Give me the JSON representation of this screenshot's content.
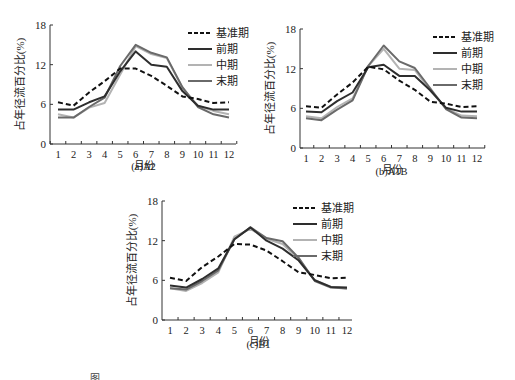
{
  "figure": {
    "caption_partial": "图"
  },
  "legend": {
    "baseline": "基准期",
    "early": "前期",
    "mid": "中期",
    "late": "末期"
  },
  "colors": {
    "baseline": "#111111",
    "early": "#2e2e2e",
    "mid": "#b3b3b3",
    "late": "#6a6a6a"
  },
  "chart_data": [
    {
      "type": "line",
      "title": "(a)A2",
      "xlabel": "月份",
      "ylabel": "占年径流百分比(%)",
      "ylim": [
        0,
        18
      ],
      "yticks": [
        0,
        6,
        12,
        18
      ],
      "grid": false,
      "legend_position": "upper right",
      "x": [
        1,
        2,
        3,
        4,
        5,
        6,
        7,
        8,
        9,
        10,
        11,
        12
      ],
      "series": [
        {
          "name": "基准期",
          "style": "dashed",
          "values": [
            6.3,
            5.8,
            7.8,
            9.5,
            11.4,
            11.4,
            10.3,
            8.8,
            7.2,
            6.8,
            6.2,
            6.3
          ]
        },
        {
          "name": "前期",
          "style": "solid",
          "values": [
            5.2,
            5.2,
            6.3,
            7.2,
            11.0,
            14.0,
            12.0,
            11.7,
            8.0,
            5.8,
            5.2,
            5.2
          ]
        },
        {
          "name": "中期",
          "style": "solid",
          "values": [
            4.5,
            4.0,
            5.5,
            6.2,
            10.5,
            14.8,
            13.6,
            13.0,
            8.5,
            5.8,
            5.0,
            4.5
          ]
        },
        {
          "name": "末期",
          "style": "solid",
          "values": [
            4.0,
            4.0,
            5.6,
            7.0,
            11.8,
            15.0,
            13.8,
            13.1,
            8.6,
            5.6,
            4.5,
            4.0
          ]
        }
      ]
    },
    {
      "type": "line",
      "title": "(b)A1B",
      "xlabel": "月份",
      "ylabel": "占年径流百分比(%)",
      "ylim": [
        0,
        18
      ],
      "yticks": [
        0,
        6,
        12,
        18
      ],
      "grid": false,
      "legend_position": "upper right",
      "x": [
        1,
        2,
        3,
        4,
        5,
        6,
        7,
        8,
        9,
        10,
        11,
        12
      ],
      "series": [
        {
          "name": "基准期",
          "style": "dashed",
          "values": [
            6.3,
            6.1,
            8.1,
            9.9,
            12.3,
            11.9,
            10.2,
            8.8,
            7.0,
            6.7,
            6.2,
            6.3
          ]
        },
        {
          "name": "前期",
          "style": "solid",
          "values": [
            5.5,
            5.4,
            7.1,
            8.4,
            12.2,
            12.6,
            10.9,
            10.9,
            8.7,
            6.1,
            5.5,
            5.5
          ]
        },
        {
          "name": "中期",
          "style": "solid",
          "values": [
            4.8,
            4.5,
            6.2,
            7.5,
            12.4,
            15.0,
            12.0,
            11.8,
            8.7,
            6.0,
            4.9,
            4.8
          ]
        },
        {
          "name": "末期",
          "style": "solid",
          "values": [
            4.5,
            4.2,
            5.8,
            7.2,
            12.4,
            15.5,
            13.1,
            12.1,
            9.0,
            5.9,
            4.6,
            4.5
          ]
        }
      ]
    },
    {
      "type": "line",
      "title": "(c)B1",
      "xlabel": "月份",
      "ylabel": "占年径流百分比(%)",
      "ylim": [
        0,
        18
      ],
      "yticks": [
        0,
        6,
        12,
        18
      ],
      "grid": false,
      "legend_position": "upper right",
      "x": [
        1,
        2,
        3,
        4,
        5,
        6,
        7,
        8,
        9,
        10,
        11,
        12
      ],
      "series": [
        {
          "name": "基准期",
          "style": "dashed",
          "values": [
            6.4,
            5.9,
            8.0,
            9.6,
            11.5,
            11.4,
            10.5,
            8.9,
            7.2,
            6.8,
            6.3,
            6.4
          ]
        },
        {
          "name": "前期",
          "style": "solid",
          "values": [
            5.2,
            4.9,
            6.2,
            7.8,
            12.2,
            14.0,
            12.0,
            10.8,
            9.0,
            6.0,
            5.0,
            4.9
          ]
        },
        {
          "name": "中期",
          "style": "solid",
          "values": [
            4.8,
            4.4,
            5.6,
            7.2,
            12.6,
            13.8,
            12.3,
            11.5,
            9.2,
            6.0,
            5.0,
            4.7
          ]
        },
        {
          "name": "末期",
          "style": "solid",
          "values": [
            4.8,
            4.6,
            5.9,
            7.5,
            12.2,
            14.0,
            12.4,
            11.9,
            9.4,
            5.9,
            4.9,
            4.8
          ]
        }
      ]
    }
  ]
}
